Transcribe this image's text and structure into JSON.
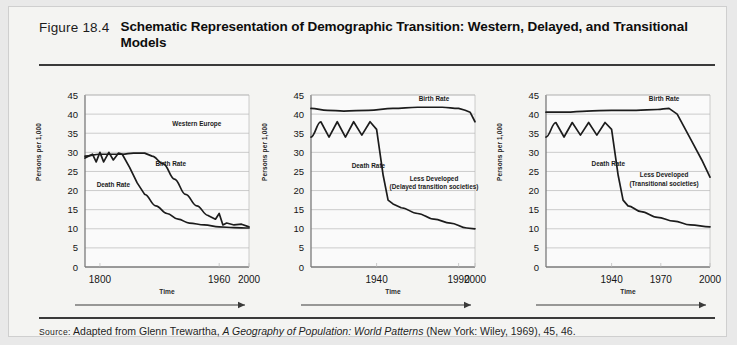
{
  "figure": {
    "number": "Figure 18.4",
    "title": "Schematic Representation of Demographic Transition: Western, Delayed, and Transitional Models",
    "source_prefix": "Source:",
    "source_text_before": " Adapted from Glenn Trewartha, ",
    "source_italic": "A Geography of Population: World Patterns",
    "source_text_after": " (New York: Wiley, 1969), 45, 46."
  },
  "colors": {
    "page_background": "#e9e9e9",
    "card_background": "#f4f4f2",
    "plot_background": "#fafafa",
    "curve": "#1c1c1c",
    "gridline": "#b8b8b8",
    "axis": "#7a7a7a",
    "rule": "#3a3a3a"
  },
  "chart_data": [
    {
      "type": "line",
      "title": "Western Europe",
      "panel_label": "Western Europe",
      "xlabel": "Time",
      "ylabel": "Persons per 1,000",
      "ylim": [
        0,
        45
      ],
      "yticks": [
        0,
        5,
        10,
        15,
        20,
        25,
        30,
        35,
        40,
        45
      ],
      "xticks": [
        1800,
        1960,
        2000
      ],
      "xlim": [
        1780,
        2000
      ],
      "grid": true,
      "legend": "inline-annotations",
      "annotations": [
        "Western Europe",
        "Birth Rate",
        "Death Rate"
      ],
      "series": [
        {
          "name": "Birth Rate",
          "x": [
            1780,
            1800,
            1815,
            1830,
            1845,
            1860,
            1870,
            1885,
            1900,
            1915,
            1930,
            1945,
            1955,
            1960,
            1965,
            1970,
            1980,
            1990,
            2000
          ],
          "values": [
            29,
            29.5,
            29.5,
            29.5,
            29.8,
            29.8,
            29,
            27,
            23,
            19,
            16,
            13.5,
            12.5,
            14,
            11,
            11.5,
            11,
            11.2,
            10.5
          ]
        },
        {
          "name": "Death Rate",
          "x": [
            1780,
            1790,
            1795,
            1800,
            1805,
            1812,
            1818,
            1825,
            1830,
            1840,
            1850,
            1860,
            1875,
            1890,
            1905,
            1920,
            1940,
            1960,
            1980,
            2000
          ],
          "values": [
            28.5,
            29.5,
            27.5,
            30,
            27.5,
            30,
            28,
            29.8,
            29.5,
            26,
            22,
            19,
            16,
            14,
            12.5,
            11.5,
            11,
            10.5,
            10.3,
            10.2
          ]
        }
      ]
    },
    {
      "type": "line",
      "title": "Less Developed (Delayed transition societies)",
      "panel_label_line1": "Less Developed",
      "panel_label_line2": "(Delayed transition societies)",
      "xlabel": "Time",
      "ylabel": "Persons per 1,000",
      "ylim": [
        0,
        45
      ],
      "yticks": [
        0,
        5,
        10,
        15,
        20,
        25,
        30,
        35,
        40,
        45
      ],
      "xticks": [
        1940,
        1990,
        2000
      ],
      "xlim": [
        1900,
        2000
      ],
      "grid": true,
      "annotations": [
        "Birth Rate",
        "Death Rate",
        "Less Developed",
        "(Delayed transition societies)"
      ],
      "series": [
        {
          "name": "Birth Rate",
          "x": [
            1900,
            1910,
            1920,
            1935,
            1950,
            1965,
            1980,
            1990,
            1994,
            1997,
            2000
          ],
          "values": [
            41.5,
            41,
            40.8,
            41,
            41.5,
            41.8,
            41.8,
            41.5,
            41,
            40.5,
            38
          ]
        },
        {
          "name": "Death Rate",
          "x": [
            1900,
            1906,
            1911,
            1916,
            1921,
            1926,
            1931,
            1936,
            1940,
            1944,
            1947,
            1950,
            1955,
            1965,
            1975,
            1985,
            1995,
            2000
          ],
          "values": [
            34,
            38,
            34,
            38,
            34,
            38,
            34.5,
            38,
            36,
            24,
            17.5,
            16.5,
            15.5,
            14,
            12.5,
            11.5,
            10.2,
            10
          ]
        }
      ]
    },
    {
      "type": "line",
      "title": "Less Developed (Transitional societies)",
      "panel_label_line1": "Less Developed",
      "panel_label_line2": "(Transitional  societies)",
      "xlabel": "Time",
      "ylabel": "Persons per 1,000",
      "ylim": [
        0,
        45
      ],
      "yticks": [
        0,
        5,
        10,
        15,
        20,
        25,
        30,
        35,
        40,
        45
      ],
      "xticks": [
        1940,
        1970,
        2000
      ],
      "xlim": [
        1900,
        2000
      ],
      "grid": true,
      "annotations": [
        "Birth Rate",
        "Death Rate",
        "Less Developed",
        "(Transitional  societies)"
      ],
      "series": [
        {
          "name": "Birth Rate",
          "x": [
            1900,
            1912,
            1925,
            1940,
            1955,
            1968,
            1975,
            1980,
            1985,
            1990,
            1995,
            2000
          ],
          "values": [
            40.5,
            40.5,
            40.8,
            41,
            41,
            41.2,
            41.5,
            40,
            36,
            32,
            28,
            23.5
          ]
        },
        {
          "name": "Death Rate",
          "x": [
            1900,
            1906,
            1911,
            1916,
            1921,
            1926,
            1931,
            1936,
            1940,
            1944,
            1947,
            1950,
            1958,
            1968,
            1978,
            1988,
            2000
          ],
          "values": [
            34,
            37.8,
            34,
            37.8,
            34.5,
            37.8,
            34.5,
            37.8,
            36,
            24,
            17.5,
            16,
            14.5,
            13,
            12,
            11,
            10.5
          ]
        }
      ]
    }
  ]
}
